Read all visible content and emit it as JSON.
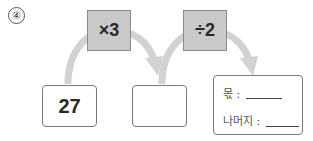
{
  "problem": {
    "number_label": "④"
  },
  "operations": [
    {
      "label": "×3"
    },
    {
      "label": "÷2"
    }
  ],
  "values": {
    "start": "27",
    "middle": ""
  },
  "answer_box": {
    "quotient_label": "몫 :",
    "quotient_value": "",
    "remainder_label": "나머지 :",
    "remainder_value": ""
  },
  "colors": {
    "op_box_fill": "#c9c9c9",
    "arrow_color": "#cfcfcf",
    "border": "#777777"
  }
}
